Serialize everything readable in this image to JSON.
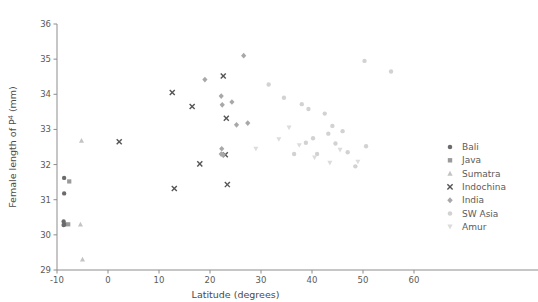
{
  "chart_data": {
    "type": "scatter",
    "title": "",
    "xlabel": "Latitude (degrees)",
    "ylabel": "Female length of P4 (mm)",
    "ylabel_base": "Female length of P",
    "ylabel_sup": "4",
    "ylabel_unit": " (mm)",
    "xlim": [
      -10,
      60
    ],
    "ylim": [
      29,
      36
    ],
    "xticks": [
      -10,
      0,
      10,
      20,
      30,
      40,
      50,
      60
    ],
    "xticklabels": [
      "-10",
      "0",
      "10",
      "20",
      "30",
      "40",
      "50",
      "60"
    ],
    "yticks": [
      29,
      30,
      31,
      32,
      33,
      34,
      35,
      36
    ],
    "yticklabels": [
      "29",
      "30",
      "31",
      "32",
      "33",
      "34",
      "35",
      "36"
    ],
    "grid": false,
    "legend_position": "right",
    "series": [
      {
        "name": "Bali",
        "marker": "circle",
        "color": "#6b6b6b",
        "points": [
          {
            "x": -8.6,
            "y": 31.62
          },
          {
            "x": -8.6,
            "y": 31.18
          },
          {
            "x": -8.7,
            "y": 30.38
          },
          {
            "x": -8.7,
            "y": 30.28
          },
          {
            "x": -8.4,
            "y": 30.3
          }
        ]
      },
      {
        "name": "Java",
        "marker": "square",
        "color": "#9a9a9a",
        "points": [
          {
            "x": -7.6,
            "y": 31.52
          },
          {
            "x": -7.8,
            "y": 30.3
          }
        ]
      },
      {
        "name": "Sumatra",
        "marker": "triangle",
        "color": "#c3c3c3",
        "points": [
          {
            "x": -5.2,
            "y": 32.68
          },
          {
            "x": -5.4,
            "y": 30.3
          },
          {
            "x": -5.0,
            "y": 29.3
          }
        ]
      },
      {
        "name": "Indochina",
        "marker": "cross",
        "color": "#555555",
        "points": [
          {
            "x": 2.2,
            "y": 32.65
          },
          {
            "x": 12.6,
            "y": 34.05
          },
          {
            "x": 13.0,
            "y": 31.32
          },
          {
            "x": 16.5,
            "y": 33.65
          },
          {
            "x": 18.0,
            "y": 32.02
          },
          {
            "x": 22.6,
            "y": 34.52
          },
          {
            "x": 23.2,
            "y": 33.32
          },
          {
            "x": 23.0,
            "y": 32.28
          },
          {
            "x": 23.4,
            "y": 31.43
          }
        ]
      },
      {
        "name": "India",
        "marker": "diamond",
        "color": "#a8a8a8",
        "points": [
          {
            "x": 19.0,
            "y": 34.42
          },
          {
            "x": 22.2,
            "y": 33.95
          },
          {
            "x": 22.4,
            "y": 33.7
          },
          {
            "x": 24.3,
            "y": 33.78
          },
          {
            "x": 26.6,
            "y": 35.1
          },
          {
            "x": 25.2,
            "y": 33.13
          },
          {
            "x": 27.4,
            "y": 33.18
          },
          {
            "x": 22.3,
            "y": 32.45
          },
          {
            "x": 22.2,
            "y": 32.3
          },
          {
            "x": 22.6,
            "y": 32.28
          }
        ]
      },
      {
        "name": "SW Asia",
        "marker": "circle-light",
        "color": "#d2d2d2",
        "points": [
          {
            "x": 31.5,
            "y": 34.28
          },
          {
            "x": 34.5,
            "y": 33.9
          },
          {
            "x": 36.5,
            "y": 32.3
          },
          {
            "x": 38.0,
            "y": 33.72
          },
          {
            "x": 39.3,
            "y": 33.58
          },
          {
            "x": 38.8,
            "y": 32.62
          },
          {
            "x": 40.2,
            "y": 32.75
          },
          {
            "x": 41.0,
            "y": 32.3
          },
          {
            "x": 42.5,
            "y": 33.45
          },
          {
            "x": 43.2,
            "y": 32.88
          },
          {
            "x": 44.0,
            "y": 33.1
          },
          {
            "x": 44.6,
            "y": 32.6
          },
          {
            "x": 46.0,
            "y": 32.95
          },
          {
            "x": 47.0,
            "y": 32.35
          },
          {
            "x": 48.5,
            "y": 31.95
          },
          {
            "x": 50.3,
            "y": 34.95
          },
          {
            "x": 50.6,
            "y": 32.52
          },
          {
            "x": 55.5,
            "y": 34.65
          }
        ]
      },
      {
        "name": "Amur",
        "marker": "triangle-down",
        "color": "#dcdcdc",
        "points": [
          {
            "x": 29.0,
            "y": 32.45
          },
          {
            "x": 33.5,
            "y": 32.72
          },
          {
            "x": 35.5,
            "y": 33.05
          },
          {
            "x": 37.5,
            "y": 32.55
          },
          {
            "x": 40.5,
            "y": 32.2
          },
          {
            "x": 43.5,
            "y": 32.05
          },
          {
            "x": 45.5,
            "y": 32.42
          },
          {
            "x": 49.0,
            "y": 32.08
          }
        ]
      }
    ]
  },
  "legend": {
    "items": [
      {
        "label": "Bali",
        "marker": "circle",
        "color": "#6b6b6b"
      },
      {
        "label": "Java",
        "marker": "square",
        "color": "#9a9a9a"
      },
      {
        "label": "Sumatra",
        "marker": "triangle",
        "color": "#c3c3c3"
      },
      {
        "label": "Indochina",
        "marker": "cross",
        "color": "#555555"
      },
      {
        "label": "India",
        "marker": "diamond",
        "color": "#a8a8a8"
      },
      {
        "label": "SW Asia",
        "marker": "circle-light",
        "color": "#d2d2d2"
      },
      {
        "label": "Amur",
        "marker": "triangle-down",
        "color": "#dcdcdc"
      }
    ]
  }
}
